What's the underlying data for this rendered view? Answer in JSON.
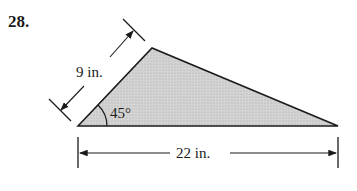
{
  "problem": {
    "number": "28."
  },
  "figure": {
    "shape": "triangle",
    "side_label": "9 in.",
    "base_label": "22 in.",
    "angle_label": "45°",
    "fill_color": "#c8c8c8",
    "stroke_color": "#1a1a1a"
  }
}
